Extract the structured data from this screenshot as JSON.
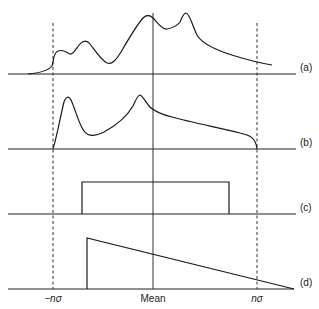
{
  "diagram": {
    "panels": [
      {
        "id": "a",
        "label": "(a)",
        "description": "Multimodal distribution with long right tail"
      },
      {
        "id": "b",
        "label": "(b)",
        "description": "Bimodal distribution bounded between -n sigma and n sigma"
      },
      {
        "id": "c",
        "label": "(c)",
        "description": "Uniform (rectangular) distribution"
      },
      {
        "id": "d",
        "label": "(d)",
        "description": "Right-triangular distribution decreasing to zero"
      }
    ],
    "x_axis_labels": {
      "left": "−nσ",
      "center": "Mean",
      "right": "nσ"
    },
    "reference_lines": {
      "left_dashed": "−nσ",
      "center_solid": "Mean",
      "right_dashed": "nσ"
    },
    "colors": {
      "line": "#1a1a1a",
      "background": "#ffffff"
    }
  }
}
